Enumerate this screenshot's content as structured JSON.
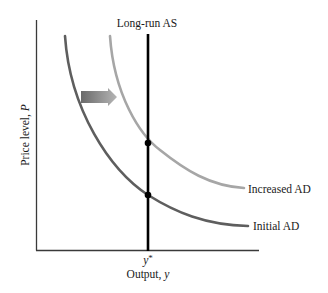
{
  "diagram": {
    "title": "Long-run AS",
    "y_axis_label": "Price level, P",
    "x_axis_label": "Output, y",
    "x_tick_label": "y*",
    "curves": [
      {
        "name": "Initial AD",
        "label": "Initial AD",
        "color": "#5e5e5e"
      },
      {
        "name": "Increased AD",
        "label": "Increased AD",
        "color": "#a6a6a6"
      },
      {
        "name": "Long-run AS",
        "label": "Long-run AS",
        "color": "#000000"
      }
    ],
    "shift_arrow": {
      "direction": "right",
      "from_color": "#6a6a6a",
      "to_color": "#b0b0b0"
    },
    "equilibria": [
      {
        "name": "initial-equilibrium",
        "x": "y*",
        "curve": "Initial AD"
      },
      {
        "name": "new-equilibrium",
        "x": "y*",
        "curve": "Increased AD"
      }
    ]
  },
  "labels": {
    "title": "Long-run AS",
    "y_axis": "Price level, ",
    "y_axis_var": "P",
    "x_axis": "Output, ",
    "x_axis_var": "y",
    "x_tick": "y",
    "x_tick_sup": "*",
    "increased_ad": "Increased AD",
    "initial_ad": "Initial AD"
  }
}
